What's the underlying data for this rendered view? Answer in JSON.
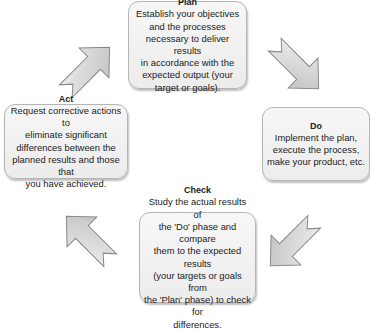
{
  "diagram": {
    "type": "PDCA cycle",
    "nodes": [
      {
        "id": "plan",
        "title": "Plan",
        "body": "Establish your objectives\nand the processes\nnecessary to deliver results\nin accordance with the\nexpected output (your\ntarget or goals)."
      },
      {
        "id": "do",
        "title": "Do",
        "body": "Implement the plan,\nexecute the process,\nmake your product, etc."
      },
      {
        "id": "check",
        "title": "Check",
        "body": "Study the actual results of\nthe 'Do' phase and compare\nthem to the expected results\n(your targets or goals from\nthe 'Plan' phase) to check for\ndifferences."
      },
      {
        "id": "act",
        "title": "Act",
        "body": "Request corrective actions to\neliminate significant\ndifferences between the\nplanned results and those that\nyou have achieved."
      }
    ],
    "edges": [
      {
        "from": "plan",
        "to": "do",
        "icon": "arrow-down-right-icon"
      },
      {
        "from": "do",
        "to": "check",
        "icon": "arrow-down-left-icon"
      },
      {
        "from": "check",
        "to": "act",
        "icon": "arrow-up-left-icon"
      },
      {
        "from": "act",
        "to": "plan",
        "icon": "arrow-up-right-icon"
      }
    ],
    "colors": {
      "box_fill": "#f2f2f2",
      "box_border": "#b5b5b5",
      "arrow_fill": "#d4d4d4",
      "arrow_stroke": "#8a8a8a"
    }
  }
}
